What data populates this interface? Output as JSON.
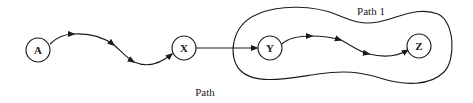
{
  "diagram": {
    "nodes": [
      {
        "id": "A",
        "label": "A"
      },
      {
        "id": "X",
        "label": "X"
      },
      {
        "id": "Y",
        "label": "Y"
      },
      {
        "id": "Z",
        "label": "Z"
      }
    ],
    "edges": [
      {
        "from": "A",
        "to": "X",
        "style": "curved-path",
        "arrows": 3
      },
      {
        "from": "X",
        "to": "Y",
        "style": "straight"
      },
      {
        "from": "Y",
        "to": "Z",
        "style": "curved-path",
        "arrows": 3
      }
    ],
    "groups": [
      {
        "id": "path1",
        "label": "Path 1",
        "contains": [
          "Y",
          "Z"
        ]
      }
    ],
    "labels": {
      "path_caption": "Path",
      "group_caption": "Path 1"
    },
    "colors": {
      "stroke": "#1a1a1a",
      "background": "#ffffff"
    }
  }
}
